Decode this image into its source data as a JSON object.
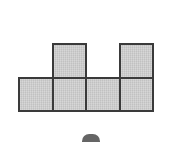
{
  "figure": {
    "name": "polyomino-hexomino",
    "shape_type": "polyomino",
    "square_count": 6,
    "grid": {
      "columns": 4,
      "rows": 2,
      "origin_x": 18,
      "origin_y": 43,
      "cell_size": 33.5
    },
    "style": {
      "fill_color": "#c9c9c9",
      "border_color": "#3a3a3a",
      "border_width": 2,
      "background_color": "#ffffff"
    },
    "cells": [
      {
        "label": "top-square-col2",
        "row": 0,
        "col": 1
      },
      {
        "label": "top-square-col4",
        "row": 0,
        "col": 3
      },
      {
        "label": "bottom-square-col1",
        "row": 1,
        "col": 0
      },
      {
        "label": "bottom-square-col2",
        "row": 1,
        "col": 1
      },
      {
        "label": "bottom-square-col3",
        "row": 1,
        "col": 2
      },
      {
        "label": "bottom-square-col4",
        "row": 1,
        "col": 3
      }
    ]
  },
  "caption_mark": {
    "visible": true,
    "x": 82,
    "y": 134,
    "width": 18,
    "height": 8,
    "color": "#4a4a4a"
  }
}
